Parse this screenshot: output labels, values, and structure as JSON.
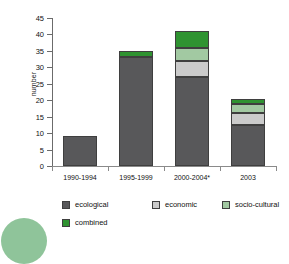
{
  "chart_data": {
    "type": "bar",
    "subtype": "stacked-bar",
    "title": "",
    "xlabel": "",
    "ylabel": "number",
    "ylim": [
      0,
      45
    ],
    "ytick_step": 5,
    "yticks": [
      0,
      5,
      10,
      15,
      20,
      25,
      30,
      35,
      40,
      45
    ],
    "ytick_labels": [
      "0",
      "5",
      "10",
      "15",
      "20",
      "25",
      "30",
      "35",
      "40",
      "45"
    ],
    "grid": false,
    "legend_position": "bottom",
    "categories": [
      "1990-1994",
      "1995-1999",
      "2000-2004*",
      "2003"
    ],
    "series": [
      {
        "name": "ecological",
        "color": "#58585a",
        "values": [
          9,
          33,
          27,
          12.5
        ]
      },
      {
        "name": "economic",
        "color": "#cbcbcb",
        "values": [
          0,
          0,
          5,
          3.5
        ]
      },
      {
        "name": "socio-cultural",
        "color": "#a2c9a2",
        "values": [
          0,
          0,
          4,
          3
        ]
      },
      {
        "name": "combined",
        "color": "#2f9331",
        "values": [
          0,
          2,
          5,
          1.5
        ]
      }
    ],
    "totals": [
      9,
      35,
      41,
      20.5
    ],
    "annotations": []
  },
  "legend": {
    "rows": [
      [
        {
          "label": "ecological",
          "color": "#58585a"
        },
        {
          "label": "economic",
          "color": "#cbcbcb"
        },
        {
          "label": "socio-cultural",
          "color": "#a2c9a2"
        }
      ],
      [
        {
          "label": "combined",
          "color": "#2f9331"
        }
      ]
    ]
  },
  "decoration": {
    "circle_color": "#8FC49A"
  }
}
